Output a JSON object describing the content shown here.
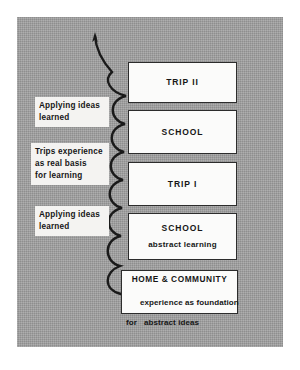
{
  "figure": {
    "background_color": "#9b9b9b",
    "box_fill": "#fbfbfa",
    "line_color": "#1a1a1a"
  },
  "stages": [
    {
      "id": "trip-2",
      "title": "TRIP II",
      "subtitle": "",
      "subtitle2": ""
    },
    {
      "id": "school-2",
      "title": "SCHOOL",
      "subtitle": "",
      "subtitle2": ""
    },
    {
      "id": "trip-1",
      "title": "TRIP I",
      "subtitle": "",
      "subtitle2": ""
    },
    {
      "id": "school-1",
      "title": "SCHOOL",
      "subtitle": "abstract learning",
      "subtitle2": ""
    },
    {
      "id": "home-community",
      "title": "HOME & COMMUNITY",
      "subtitle": "experience as foundation",
      "subtitle2": "for   abstract ideas"
    }
  ],
  "annotations": [
    {
      "id": "applying-ideas-top",
      "text": "Applying ideas\nlearned"
    },
    {
      "id": "trips-experience",
      "text": "Trips experience\nas real basis\nfor learning"
    },
    {
      "id": "applying-ideas-bottom",
      "text": "Applying ideas\nlearned"
    }
  ],
  "connector": {
    "name": "upward-progression-arrow",
    "direction": "upward"
  }
}
